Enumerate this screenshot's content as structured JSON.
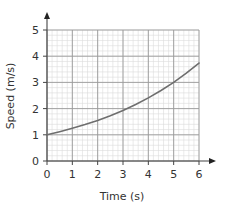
{
  "chart_data": {
    "type": "line",
    "title": "",
    "xlabel": "Time (s)",
    "ylabel": "Speed (m/s)",
    "xlim": [
      0,
      6
    ],
    "ylim": [
      0,
      5
    ],
    "x_ticks": [
      0,
      1,
      2,
      3,
      4,
      5,
      6
    ],
    "y_ticks": [
      0,
      1,
      2,
      3,
      4,
      5
    ],
    "x_tick_labels": [
      "0",
      "1",
      "2",
      "3",
      "4",
      "5",
      "6"
    ],
    "y_tick_labels": [
      "0",
      "1",
      "2",
      "3",
      "4",
      "5"
    ],
    "grid": true,
    "minor_divisions_per_unit": 5,
    "legend": null,
    "series": [
      {
        "name": "speed",
        "x": [
          0,
          0.5,
          1,
          1.5,
          2,
          2.5,
          3,
          3.5,
          4,
          4.5,
          5,
          5.5,
          6
        ],
        "values": [
          1.0,
          1.12,
          1.25,
          1.39,
          1.55,
          1.73,
          1.93,
          2.16,
          2.41,
          2.69,
          3.0,
          3.35,
          3.74
        ]
      }
    ]
  },
  "colors": {
    "curve": "#6e6e6e",
    "axis": "#444444",
    "major_grid": "#9a9a9a",
    "minor_grid": "#dcdcdc"
  }
}
